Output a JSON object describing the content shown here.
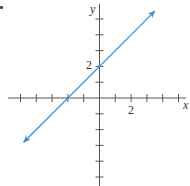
{
  "chart_data": {
    "type": "line",
    "title": "",
    "xlabel": "x",
    "ylabel": "y",
    "xlim": [
      -5,
      5
    ],
    "ylim": [
      -5,
      5
    ],
    "grid": false,
    "x_tick_step": 1,
    "y_tick_step": 1,
    "tick_labels": {
      "x": [
        "2"
      ],
      "y": [
        "2"
      ]
    },
    "series": [
      {
        "name": "line",
        "equation": "y = x + 2",
        "slope": 1,
        "intercept": 2,
        "x_intercept": -2,
        "arrows": "both",
        "color": "#3b8fd1",
        "points": [
          [
            -4.8,
            -2.8
          ],
          [
            -2,
            0
          ],
          [
            0,
            2
          ],
          [
            3.5,
            5.5
          ]
        ]
      }
    ]
  },
  "labels": {
    "x_axis": "x",
    "y_axis": "y",
    "x_tick_2": "2",
    "y_tick_2": "2"
  },
  "colors": {
    "line": "#3b8fd1",
    "axis": "#444444"
  }
}
